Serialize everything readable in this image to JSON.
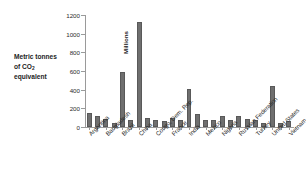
{
  "labels": {
    "side_note_line1": "Metric tonnes",
    "side_note_line2": "of CO",
    "side_note_sub": "2",
    "side_note_line3": "equivalent",
    "axis_unit": "Millions"
  },
  "chart_data": {
    "type": "bar",
    "title": "",
    "subtitle": "",
    "xlabel": "",
    "ylabel": "Millions",
    "annotation": "Metric tonnes of CO2 equivalent",
    "ylim": [
      0,
      1200
    ],
    "yticks": [
      0,
      200,
      400,
      600,
      800,
      1000,
      1200
    ],
    "ytick_labels": [
      "0",
      "200",
      "400",
      "600",
      "800",
      "1000",
      "1200"
    ],
    "grid": false,
    "legend": false,
    "bar_color": "#6f6f6f",
    "axis_color": "#9a9a9a",
    "categories": [
      "Argentina",
      "",
      "Bangladesh",
      "",
      "Brazil",
      "",
      "China",
      "",
      "Congo, Dem. Rep.",
      "",
      "France",
      "",
      "India",
      "",
      "Mexico",
      "",
      "Nigeria",
      "",
      "Russian Federation",
      "",
      "Turkey",
      "",
      "United States",
      "",
      "Vietnam"
    ],
    "labeled_categories": [
      "Argentina",
      "Bangladesh",
      "Brazil",
      "China",
      "Congo, Dem. Rep.",
      "France",
      "India",
      "Mexico",
      "Nigeria",
      "Russian Federation",
      "Turkey",
      "United States",
      "Vietnam"
    ],
    "values": [
      150,
      115,
      85,
      45,
      590,
      75,
      1120,
      95,
      80,
      65,
      100,
      80,
      405,
      135,
      80,
      75,
      120,
      80,
      120,
      85,
      75,
      45,
      435,
      40,
      60
    ]
  }
}
